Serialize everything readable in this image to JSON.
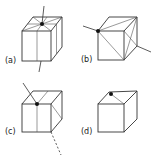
{
  "figure": {
    "panels": [
      {
        "id": "a",
        "label": "(a)",
        "description": "Cube with vertex at center of top face; radial lines from center to top face edges; line passing vertically through cube"
      },
      {
        "id": "b",
        "label": "(b)",
        "description": "Cube with vertex at front-top-left corner; diagonal line through cube to back-bottom-right corner"
      },
      {
        "id": "c",
        "label": "(c)",
        "description": "Cube with vertex at middle of front-top edge; line entering from upper left, dashed line exiting lower right"
      },
      {
        "id": "d",
        "label": "(d)",
        "description": "Cube with vertex on top face near back-left edge; lines from vertex to front-top corners"
      }
    ],
    "colors": {
      "line": "#333333",
      "dot": "#111111",
      "background": "#ffffff"
    }
  }
}
